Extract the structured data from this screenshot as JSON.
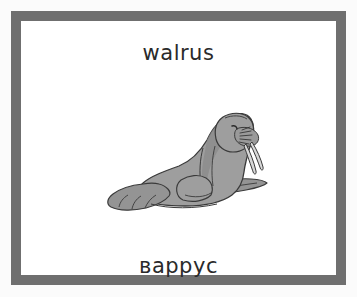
{
  "card": {
    "english_word": "walrus",
    "cyrillic_word": "варрус",
    "border_color": "#6f6f6f",
    "card_background": "#ffffff",
    "page_background": "#fbfbfb",
    "text_color": "#2a2a2a"
  },
  "illustration": {
    "subject": "walrus-illustration",
    "body_fill": "#9e9e9e",
    "body_shade": "#8a8a8a",
    "outline_color": "#3a3a3a",
    "tusk_fill": "#d8d8d8",
    "flipper_fill": "#949494"
  }
}
